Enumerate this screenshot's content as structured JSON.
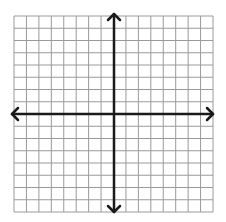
{
  "diagram": {
    "type": "coordinate-plane",
    "title": "",
    "grid": {
      "columns": 16,
      "rows": 16,
      "left": 14,
      "top": 16,
      "right": 213,
      "bottom": 212,
      "line_color": "#9a9a9a",
      "line_width": 1
    },
    "axes": {
      "x_axis_y": 114,
      "y_axis_x": 114,
      "x_start": 12,
      "x_end": 213,
      "y_start": 14,
      "y_end": 212,
      "color": "#1a1a1a",
      "width": 2.5,
      "arrows": [
        "left",
        "right",
        "up",
        "down"
      ],
      "labels_visible": false
    },
    "background": "#ffffff"
  }
}
